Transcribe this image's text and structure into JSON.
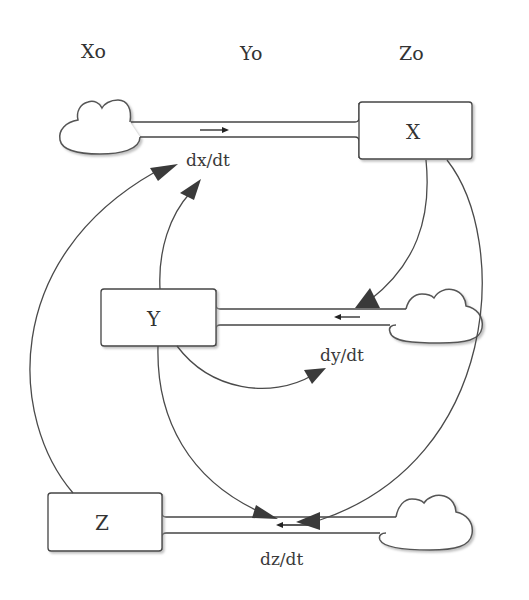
{
  "diagram": {
    "type": "stock-and-flow",
    "header_labels": [
      "Xo",
      "Yo",
      "Zo"
    ],
    "stocks": [
      {
        "id": "X",
        "label": "X"
      },
      {
        "id": "Y",
        "label": "Y"
      },
      {
        "id": "Z",
        "label": "Z"
      }
    ],
    "flows": [
      {
        "id": "dx",
        "label": "dx/dt",
        "from": "cloud",
        "to": "X"
      },
      {
        "id": "dy",
        "label": "dy/dt",
        "from": "cloud",
        "to": "Y"
      },
      {
        "id": "dz",
        "label": "dz/dt",
        "from": "cloud",
        "to": "Z"
      }
    ],
    "links": [
      {
        "from": "Z",
        "to": "dx/dt"
      },
      {
        "from": "Y",
        "to": "dx/dt"
      },
      {
        "from": "X",
        "to": "dy/dt"
      },
      {
        "from": "Y",
        "to": "dy/dt"
      },
      {
        "from": "Y",
        "to": "dz/dt"
      },
      {
        "from": "X",
        "to": "dz/dt"
      }
    ],
    "colors": {
      "line": "#444444",
      "arrow": "#3a3a3a",
      "shadow": "#bbbbbb"
    }
  }
}
